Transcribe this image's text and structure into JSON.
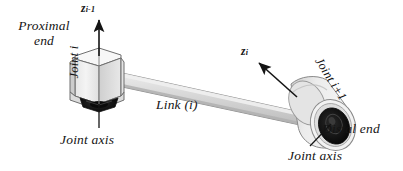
{
  "figure": {
    "background_color": "#ffffff",
    "ink_color": "#141414",
    "body_light": "#f2f2f2",
    "body_mid": "#d9d9d9",
    "body_dark": "#b4b4b4",
    "hole_color": "#111111"
  },
  "labels": {
    "proximal_end_line1": "Proximal",
    "proximal_end_line2": "end",
    "z_axis_proximal_base": "z",
    "z_axis_proximal_sub": "i-1",
    "z_axis_distal_base": "z",
    "z_axis_distal_sub": "i",
    "joint_i": "Joint i",
    "joint_i_plus_1": "Joint i+1",
    "link_i": "Link (i)",
    "joint_axis_left": "Joint axis",
    "joint_axis_right": "Joint axis",
    "distal_end": "Distal end"
  },
  "elements": {
    "proximal_joint_shape": "hexagonal-prism",
    "distal_joint_shape": "cylinder",
    "link_shape": "tapered-bar",
    "arrow_proximal_direction": "up",
    "arrow_distal_direction": "up-left"
  }
}
